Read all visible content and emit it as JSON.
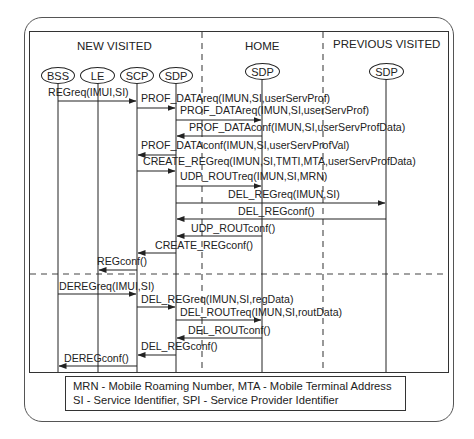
{
  "regions": [
    {
      "id": "new-visited",
      "label": "NEW  VISITED"
    },
    {
      "id": "home",
      "label": "HOME"
    },
    {
      "id": "previous-visited",
      "label": "PREVIOUS VISITED"
    }
  ],
  "participants": [
    {
      "id": "bss",
      "label": "BSS",
      "region": "new-visited"
    },
    {
      "id": "le",
      "label": "LE",
      "region": "new-visited"
    },
    {
      "id": "scp",
      "label": "SCP",
      "region": "new-visited"
    },
    {
      "id": "sdp-nv",
      "label": "SDP",
      "region": "new-visited"
    },
    {
      "id": "sdp-home",
      "label": "SDP",
      "region": "home"
    },
    {
      "id": "sdp-pv",
      "label": "SDP",
      "region": "previous-visited"
    }
  ],
  "messages": [
    {
      "label": "REGreq(IMUI,SI)",
      "from": "bss",
      "to": "scp"
    },
    {
      "label": "PROF_DATAreq(IMUN,SI,userServProf)",
      "from": "scp",
      "to": "sdp-nv"
    },
    {
      "label": "PROF_DATAreq(IMUN,SI,userServProf)",
      "from": "sdp-nv",
      "to": "sdp-home"
    },
    {
      "label": "PROF_DATAconf(IMUN,SI,userServProfData)",
      "from": "sdp-home",
      "to": "sdp-nv"
    },
    {
      "label": "PROF_DATAconf(IMUN,SI,userServProfVal)",
      "from": "sdp-nv",
      "to": "scp"
    },
    {
      "label": "CREATE_REGreq(IMUN,SI,TMTI,MTA,userServProfData)",
      "from": "scp",
      "to": "sdp-nv"
    },
    {
      "label": "UDP_ROUTreq(IMUN,SI,MRN)",
      "from": "sdp-nv",
      "to": "sdp-home"
    },
    {
      "label": "DEL_REGreq(IMUN,SI)",
      "from": "sdp-nv",
      "to": "sdp-pv"
    },
    {
      "label": "DEL_REGconf()",
      "from": "sdp-pv",
      "to": "sdp-nv"
    },
    {
      "label": "UDP_ROUTconf()",
      "from": "sdp-home",
      "to": "sdp-nv"
    },
    {
      "label": "CREATE_REGconf()",
      "from": "sdp-nv",
      "to": "scp"
    },
    {
      "label": "REGconf()",
      "from": "scp",
      "to": "le"
    },
    {
      "label": "DEREGreq(IMUI,SI)",
      "from": "bss",
      "to": "scp"
    },
    {
      "label": "DEL_REGreq(IMUN,SI,regData)",
      "from": "scp",
      "to": "sdp-nv"
    },
    {
      "label": "DEL_ROUTreq(IMUN,SI,routData)",
      "from": "sdp-nv",
      "to": "sdp-home"
    },
    {
      "label": "DEL_ROUTconf()",
      "from": "sdp-home",
      "to": "sdp-nv"
    },
    {
      "label": "DEL_REGconf()",
      "from": "sdp-nv",
      "to": "scp"
    },
    {
      "label": "DEREGconf()",
      "from": "scp",
      "to": "bss"
    }
  ],
  "legend": {
    "line1": "MRN - Mobile Roaming Number, MTA - Mobile Terminal Address",
    "line2": "SI - Service Identifier, SPI - Service Provider Identifier"
  }
}
